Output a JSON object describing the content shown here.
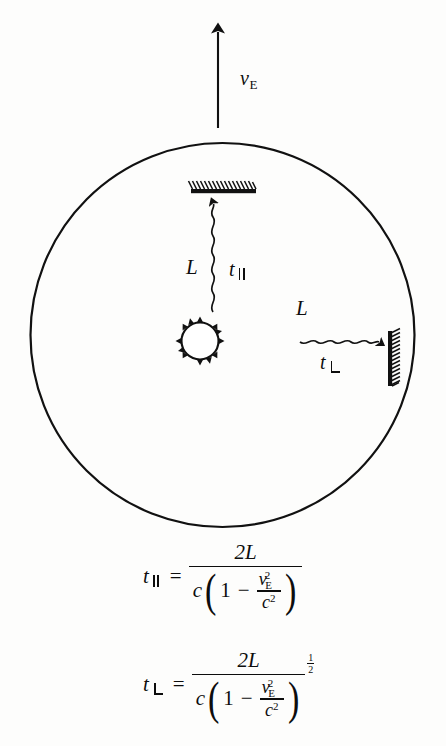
{
  "figure": {
    "background_color": "#fdfdfc",
    "ink_color": "#0d0d0d"
  },
  "labels": {
    "earth_velocity": "v",
    "earth_velocity_subscript": "E",
    "length_vertical": "L",
    "length_horizontal": "L",
    "time_parallel": "t",
    "time_perpendicular": "t"
  },
  "equations": {
    "parallel": {
      "lhs_symbol": "t",
      "lhs_subscript": "parallel",
      "equals": "=",
      "numerator": "2L",
      "denominator_leading": "c",
      "inner_one": "1",
      "inner_minus": "−",
      "inner_num_var": "v",
      "inner_num_sub": "E",
      "inner_num_exp": "2",
      "inner_den_var": "c",
      "inner_den_exp": "2",
      "exponent": null,
      "plain_text": "t_parallel = 2L / ( c ( 1 - v_E^2 / c^2 ) )"
    },
    "perpendicular": {
      "lhs_symbol": "t",
      "lhs_subscript": "perpendicular",
      "equals": "=",
      "numerator": "2L",
      "denominator_leading": "c",
      "inner_one": "1",
      "inner_minus": "−",
      "inner_num_var": "v",
      "inner_num_sub": "E",
      "inner_num_exp": "2",
      "inner_den_var": "c",
      "inner_den_exp": "2",
      "exponent_numerator": "1",
      "exponent_denominator": "2",
      "plain_text": "t_perpendicular = 2L / ( c ( 1 - v_E^2 / c^2 ) )^(1/2)"
    }
  },
  "elements": {
    "velocity_arrow": "upward-arrow",
    "earth_circle": "large-circle",
    "light_source": "sun-icon",
    "top_mirror": "hatched-mirror-horizontal",
    "right_mirror": "hatched-mirror-vertical",
    "vertical_beam": "wavy-light-ray-up",
    "horizontal_beam": "wavy-light-ray-right"
  }
}
